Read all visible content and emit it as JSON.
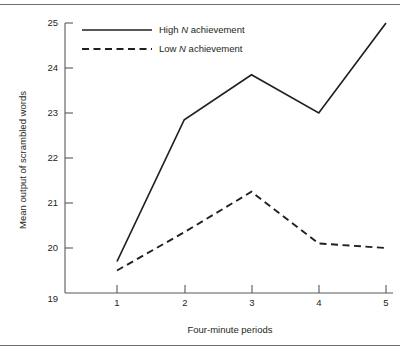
{
  "figure": {
    "has_top_rule": true,
    "has_bottom_rule": true,
    "rule_color": "#6e6e72",
    "background": "#ffffff"
  },
  "chart_data": {
    "type": "line",
    "title": "",
    "subtitle": "",
    "xlabel": "Four-minute periods",
    "ylabel": "Mean output of scrambled words",
    "x": [
      1,
      2,
      3,
      4,
      5
    ],
    "categories": [
      "1",
      "2",
      "3",
      "4",
      "5"
    ],
    "xtick_labels": [
      "1",
      "2",
      "3",
      "4",
      "5"
    ],
    "ytick_labels": [
      "19",
      "20",
      "21",
      "22",
      "23",
      "24",
      "25"
    ],
    "ytick_values": [
      19,
      20,
      21,
      22,
      23,
      24,
      25
    ],
    "ytick_marks_drawn": [
      false,
      true,
      true,
      true,
      true,
      true,
      true
    ],
    "xlim": [
      0.65,
      5.0
    ],
    "ylim": [
      19,
      25
    ],
    "grid": false,
    "legend_position": "top-left-inside",
    "series": [
      {
        "name": "High N achievement",
        "label_prefix": "High ",
        "label_italic": "N",
        "label_suffix": " achievement",
        "style": "solid",
        "color": "#231f20",
        "values": [
          19.7,
          22.85,
          23.85,
          23.0,
          25.0
        ]
      },
      {
        "name": "Low N achievement",
        "label_prefix": "Low ",
        "label_italic": "N",
        "label_suffix": " achievement",
        "style": "dashed",
        "color": "#231f20",
        "values": [
          19.5,
          20.35,
          21.25,
          20.1,
          20.0
        ]
      }
    ]
  }
}
